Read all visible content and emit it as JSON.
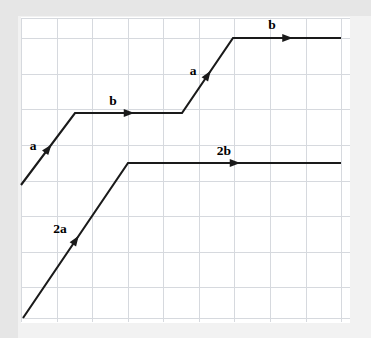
{
  "figure": {
    "width": 371,
    "height": 338,
    "colors": {
      "background": "#ffffff",
      "outer_background": "#f2f2f2",
      "edge_shade": "#e6e6e6",
      "grid": "#d6d9de",
      "vector_stroke": "#1a1a1a",
      "label_text": "#000000"
    }
  },
  "chart_data": {
    "type": "line",
    "subtitle": "",
    "xlabel": "",
    "ylabel": "",
    "grid": true,
    "legend_position": "none",
    "xlim": [
      0,
      371
    ],
    "ylim": [
      338,
      0
    ],
    "grid_spacing_px": 35.6,
    "plot_area": {
      "left": 21,
      "top": 18,
      "right": 350,
      "bottom": 322
    },
    "grid_x": [
      21,
      57,
      92,
      128,
      163,
      199,
      234,
      270,
      306,
      341
    ],
    "grid_y": [
      18,
      38,
      74,
      109,
      145,
      181,
      216,
      252,
      287,
      318
    ],
    "series": [
      {
        "name": "upper-path",
        "points": [
          [
            21,
            185
          ],
          [
            75,
            113
          ],
          [
            182,
            113
          ],
          [
            233,
            38
          ],
          [
            341,
            38
          ]
        ],
        "segments": [
          {
            "label": "a",
            "kind": "diagonal",
            "from": [
              21,
              185
            ],
            "to": [
              75,
              113
            ]
          },
          {
            "label": "b",
            "kind": "horizontal",
            "from": [
              75,
              113
            ],
            "to": [
              182,
              113
            ]
          },
          {
            "label": "a",
            "kind": "diagonal",
            "from": [
              182,
              113
            ],
            "to": [
              233,
              38
            ]
          },
          {
            "label": "b",
            "kind": "horizontal",
            "from": [
              233,
              38
            ],
            "to": [
              341,
              38
            ]
          }
        ]
      },
      {
        "name": "lower-path",
        "points": [
          [
            23,
            318
          ],
          [
            128,
            163
          ],
          [
            341,
            163
          ]
        ],
        "segments": [
          {
            "label": "2a",
            "kind": "diagonal",
            "from": [
              23,
              318
            ],
            "to": [
              128,
              163
            ]
          },
          {
            "label": "2b",
            "kind": "horizontal",
            "from": [
              128,
              163
            ],
            "to": [
              341,
              163
            ]
          }
        ]
      }
    ],
    "annotations": [
      {
        "text": "a",
        "x": 33,
        "y": 150,
        "role": "upper-first-a"
      },
      {
        "text": "b",
        "x": 113,
        "y": 105,
        "role": "upper-first-b"
      },
      {
        "text": "a",
        "x": 193,
        "y": 75,
        "role": "upper-second-a"
      },
      {
        "text": "b",
        "x": 272,
        "y": 29,
        "role": "upper-second-b"
      },
      {
        "text": "2a",
        "x": 60,
        "y": 233,
        "role": "lower-2a"
      },
      {
        "text": "2b",
        "x": 224,
        "y": 155,
        "role": "lower-2b"
      }
    ]
  },
  "labels": {
    "upper_a1": "a",
    "upper_b1": "b",
    "upper_a2": "a",
    "upper_b2": "b",
    "lower_2a": "2a",
    "lower_2b": "2b"
  }
}
